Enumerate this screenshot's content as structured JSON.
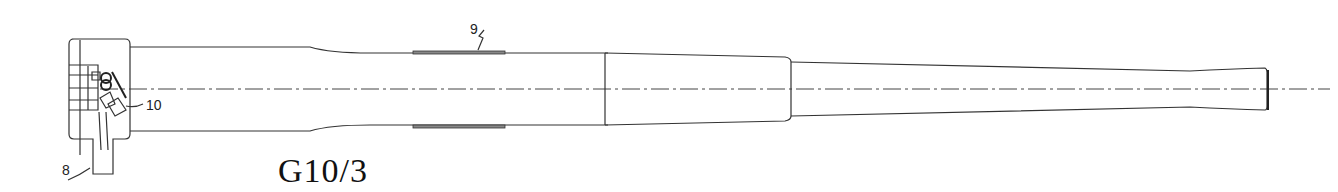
{
  "figure": {
    "caption": "G10/3",
    "reference_labels": [
      {
        "id": "8",
        "text": "8",
        "target": "grip/handle below breech"
      },
      {
        "id": "9",
        "text": "9",
        "target": "band on barrel"
      },
      {
        "id": "10",
        "text": "10",
        "target": "breech mechanism"
      }
    ],
    "components": [
      "breech-block",
      "barrel-rear-section",
      "barrel-middle-section",
      "barrel-front-taper",
      "muzzle",
      "center-axis"
    ]
  }
}
